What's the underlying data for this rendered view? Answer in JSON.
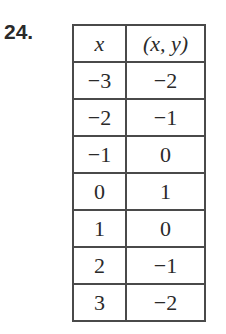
{
  "problem_number": "24.",
  "table": {
    "headers": [
      "x",
      "(x, y)"
    ],
    "rows": [
      [
        "−3",
        "−2"
      ],
      [
        "−2",
        "−1"
      ],
      [
        "−1",
        "0"
      ],
      [
        "0",
        "1"
      ],
      [
        "1",
        "0"
      ],
      [
        "2",
        "−1"
      ],
      [
        "3",
        "−2"
      ]
    ]
  }
}
